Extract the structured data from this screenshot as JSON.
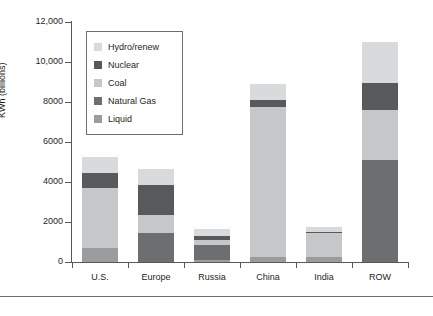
{
  "chart_data": {
    "type": "bar",
    "stacked": true,
    "title": "",
    "xlabel": "",
    "ylabel": "KWh (billions)",
    "ylim": [
      0,
      12000
    ],
    "yticks": [
      0,
      2000,
      4000,
      6000,
      8000,
      10000,
      12000
    ],
    "ytick_labels": [
      "0",
      "2000",
      "4000",
      "6000",
      "8000",
      "10,000",
      "12,000"
    ],
    "grid": false,
    "legend_position": "upper-left-inside",
    "categories": [
      "U.S.",
      "Europe",
      "Russia",
      "China",
      "India",
      "ROW"
    ],
    "series": [
      {
        "name": "Liquid",
        "color": "#9b9c9e",
        "values": [
          700,
          0,
          100,
          250,
          250,
          0
        ]
      },
      {
        "name": "Natural Gas",
        "color": "#6d6e71",
        "values": [
          0,
          1450,
          750,
          0,
          0,
          5100
        ]
      },
      {
        "name": "Coal",
        "color": "#c6c7c9",
        "values": [
          3000,
          900,
          250,
          7500,
          1200,
          2500
        ]
      },
      {
        "name": "Nuclear",
        "color": "#58595b",
        "values": [
          750,
          1500,
          200,
          350,
          50,
          1350
        ]
      },
      {
        "name": "Hydro/renew",
        "color": "#d9dadb",
        "values": [
          800,
          800,
          350,
          800,
          250,
          2050
        ]
      }
    ],
    "totals": [
      5250,
      4650,
      1650,
      8900,
      1750,
      11000
    ],
    "legend_entries": [
      {
        "label": "Hydro/renew",
        "color": "#d9dadb"
      },
      {
        "label": "Nuclear",
        "color": "#58595b"
      },
      {
        "label": "Coal",
        "color": "#c6c7c9"
      },
      {
        "label": "Natural Gas",
        "color": "#6d6e71"
      },
      {
        "label": "Liquid",
        "color": "#9b9c9e"
      }
    ]
  }
}
